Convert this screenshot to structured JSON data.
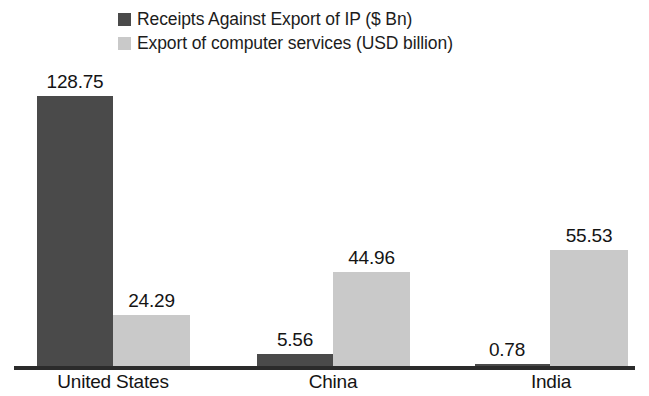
{
  "chart_data": {
    "type": "bar",
    "title": "",
    "subtitle": "",
    "xlabel": "",
    "ylabel": "",
    "grid": false,
    "legend_position": "top-left",
    "axis_visible": {
      "x": true,
      "y": false
    },
    "ylim": [
      0,
      128.75
    ],
    "categories": [
      "United States",
      "China",
      "India"
    ],
    "series": [
      {
        "name": "Receipts Against Export of IP ($ Bn)",
        "color": "#4a4a4a",
        "values": [
          128.75,
          5.56,
          0.78
        ],
        "value_labels": [
          "128.75",
          "5.56",
          "0.78"
        ]
      },
      {
        "name": "Export of computer services (USD billion)",
        "color": "#c9c9c9",
        "values": [
          24.29,
          44.96,
          55.53
        ],
        "value_labels": [
          "24.29",
          "44.96",
          "55.53"
        ]
      }
    ]
  },
  "legend": {
    "items": [
      {
        "label": "Receipts Against Export of IP ($ Bn)",
        "color": "#4a4a4a"
      },
      {
        "label": "Export of computer services (USD billion)",
        "color": "#c9c9c9"
      }
    ]
  },
  "axis": {
    "category_labels": [
      "United States",
      "China",
      "India"
    ]
  },
  "colors": {
    "series_dark": "#4a4a4a",
    "series_light": "#c9c9c9",
    "axis": "#2b2b2b",
    "text": "#141414",
    "background": "#ffffff"
  }
}
